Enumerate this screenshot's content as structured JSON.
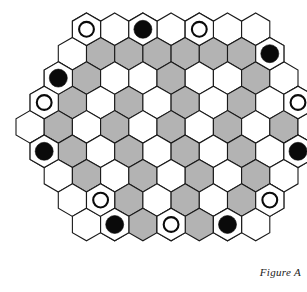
{
  "figure": {
    "caption": "Figure A",
    "title": "Figure A"
  },
  "board": {
    "name": "hexagonal-game-board",
    "shape": "hexagon",
    "orientation": "pointy-top",
    "rows": [
      7,
      8,
      9,
      10,
      11,
      10,
      9,
      8,
      7
    ],
    "total_cells": 81,
    "colors": {
      "cell_light": "#ffffff",
      "cell_shaded": "#b3b3b3",
      "outline": "#1a1a1a",
      "piece_black": "#0a0a0a",
      "piece_white": "#ffffff",
      "background": "#ffffff"
    },
    "legend": {
      "black_piece_label": "black marble",
      "white_piece_label": "white marble",
      "shaded_cell_label": "shaded cell",
      "light_cell_label": "light cell"
    },
    "geometry": {
      "hex_width": 28.2,
      "hex_height": 32.6,
      "row_step_y": 24.4,
      "origin_x": 16.0,
      "origin_y": 13.0,
      "piece_radius": 9.0
    },
    "counts": {
      "black_pieces": 7,
      "white_pieces": 5,
      "shaded_cells": 33,
      "light_cells": 48
    },
    "shaded_cells": [
      [
        1,
        1
      ],
      [
        1,
        2
      ],
      [
        1,
        3
      ],
      [
        1,
        4
      ],
      [
        1,
        5
      ],
      [
        1,
        6
      ],
      [
        2,
        1
      ],
      [
        2,
        4
      ],
      [
        2,
        7
      ],
      [
        3,
        1
      ],
      [
        3,
        3
      ],
      [
        3,
        5
      ],
      [
        3,
        7
      ],
      [
        3,
        9
      ],
      [
        4,
        1
      ],
      [
        4,
        3
      ],
      [
        4,
        5
      ],
      [
        4,
        7
      ],
      [
        4,
        9
      ],
      [
        5,
        1
      ],
      [
        5,
        3
      ],
      [
        5,
        5
      ],
      [
        5,
        7
      ],
      [
        5,
        9
      ],
      [
        6,
        1
      ],
      [
        6,
        3
      ],
      [
        6,
        5
      ],
      [
        6,
        7
      ],
      [
        7,
        2
      ],
      [
        7,
        4
      ],
      [
        7,
        6
      ],
      [
        8,
        1
      ],
      [
        8,
        2
      ],
      [
        8,
        3
      ],
      [
        8,
        4
      ],
      [
        8,
        5
      ]
    ],
    "pieces": [
      {
        "row": 0,
        "col": 0,
        "type": "white",
        "name": "piece-white-top-left"
      },
      {
        "row": 0,
        "col": 2,
        "type": "black",
        "name": "piece-black-top-center-left"
      },
      {
        "row": 0,
        "col": 4,
        "type": "white",
        "name": "piece-white-top-center-right"
      },
      {
        "row": 1,
        "col": 7,
        "type": "black",
        "name": "piece-black-upper-right"
      },
      {
        "row": 2,
        "col": 0,
        "type": "black",
        "name": "piece-black-upper-left"
      },
      {
        "row": 3,
        "col": 0,
        "type": "white",
        "name": "piece-white-left-upper"
      },
      {
        "row": 3,
        "col": 9,
        "type": "white",
        "name": "piece-white-right-upper"
      },
      {
        "row": 5,
        "col": 0,
        "type": "black",
        "name": "piece-black-left-lower"
      },
      {
        "row": 5,
        "col": 9,
        "type": "black",
        "name": "piece-black-right-lower"
      },
      {
        "row": 7,
        "col": 7,
        "type": "white",
        "name": "piece-white-right-bottom"
      },
      {
        "row": 7,
        "col": 1,
        "type": "white",
        "name": "piece-white-left-bottom"
      },
      {
        "row": 8,
        "col": 1,
        "type": "black",
        "name": "piece-black-bottom-left"
      },
      {
        "row": 8,
        "col": 3,
        "type": "white",
        "name": "piece-white-bottom-center"
      },
      {
        "row": 8,
        "col": 5,
        "type": "black",
        "name": "piece-black-bottom-right"
      }
    ]
  }
}
